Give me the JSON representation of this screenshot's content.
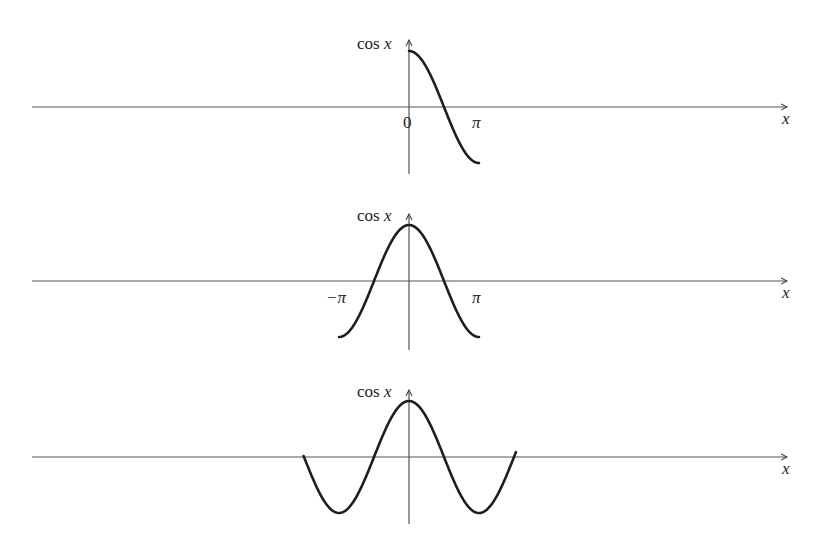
{
  "figure": {
    "panels": [
      {
        "id": "panel-1",
        "y_label": "cos",
        "y_label_var": "x",
        "x_label": "x",
        "tick_labels": [
          "0",
          "π"
        ],
        "domain": "[0, π]",
        "description": "cos x restricted to 0 ≤ x ≤ π"
      },
      {
        "id": "panel-2",
        "y_label": "cos",
        "y_label_var": "x",
        "x_label": "x",
        "tick_labels": [
          "−π",
          "π"
        ],
        "domain": "[−π, π]",
        "description": "cos x restricted to −π ≤ x ≤ π"
      },
      {
        "id": "panel-3",
        "y_label": "cos",
        "y_label_var": "x",
        "x_label": "x",
        "tick_labels": [],
        "domain": "(−∞, ∞)",
        "description": "cos x over the whole real line (periodic)"
      }
    ],
    "colors": {
      "curve": "#1e1e1e",
      "axis": "#555555",
      "text": "#222222"
    }
  }
}
